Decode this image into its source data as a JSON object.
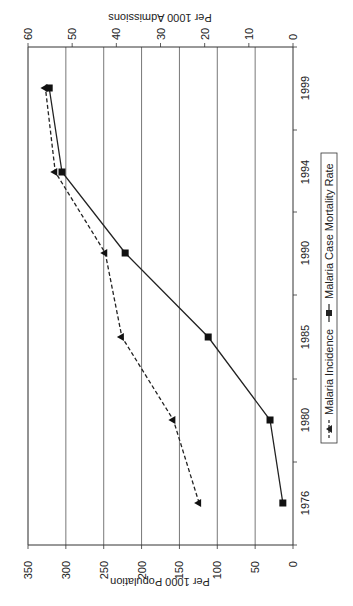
{
  "chart_data": {
    "type": "line",
    "orientation": "rotated 90 degrees counter-clockwise",
    "title": "",
    "categories": [
      "1976",
      "1980",
      "1985",
      "1990",
      "1994",
      "1999"
    ],
    "xlabel": "",
    "ylabel": "Per 1000 Population",
    "y2label": "Per 1000 Admissions",
    "ylim": [
      0,
      350
    ],
    "y2lim": [
      0,
      60
    ],
    "yticks": [
      "0",
      "50",
      "100",
      "150",
      "200",
      "250",
      "300",
      "350"
    ],
    "y2ticks": [
      "0",
      "10",
      "20",
      "30",
      "40",
      "50",
      "60"
    ],
    "grid": true,
    "legend_position": "bottom",
    "series": [
      {
        "name": "Malaria Incidence",
        "axis": "left",
        "style": "dashed",
        "marker": "triangle",
        "values": [
          124,
          158,
          226,
          248,
          314,
          327
        ]
      },
      {
        "name": "Malaria Case Mortality Rate",
        "axis": "right",
        "style": "solid",
        "marker": "square",
        "values": [
          2.3,
          5.2,
          19.2,
          38,
          52.3,
          55.2
        ]
      }
    ]
  },
  "legend": {
    "incidence_label": "Malaria Incidence",
    "mortality_label": "Malaria Case Mortality Rate"
  }
}
